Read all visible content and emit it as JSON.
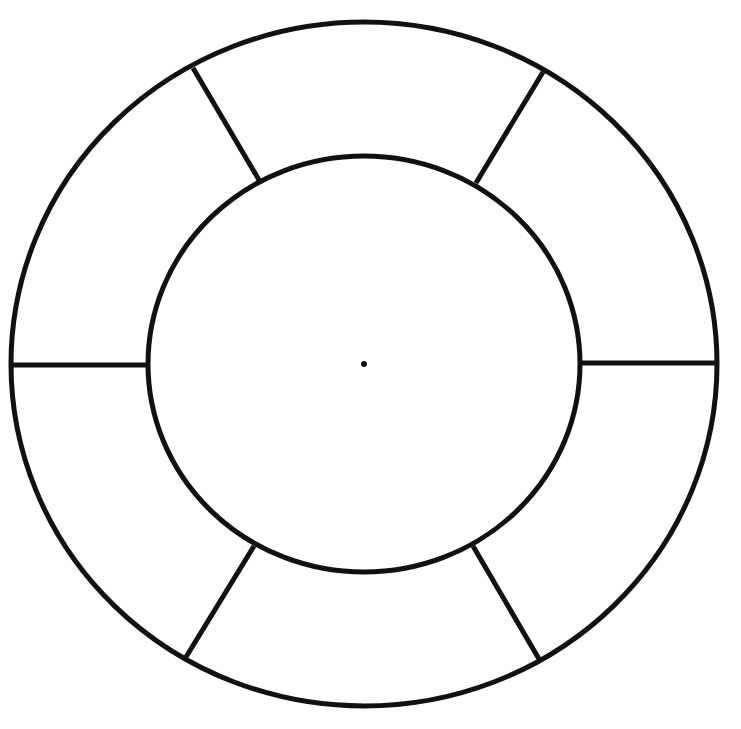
{
  "diagram": {
    "type": "segmented-ring-wheel",
    "stroke_color": "#111111",
    "background": "#ffffff",
    "center": [
      364,
      364
    ],
    "outer_ring": {
      "rx": 353,
      "ry": 342
    },
    "inner_circle": {
      "rx": 216,
      "ry": 208
    },
    "segment_count": 6,
    "spokes": [
      {
        "from": [
          259,
          180
        ],
        "to": [
          193,
          68
        ]
      },
      {
        "from": [
          476,
          183
        ],
        "to": [
          543,
          72
        ]
      },
      {
        "from": [
          580,
          363
        ],
        "to": [
          718,
          363
        ]
      },
      {
        "from": [
          473,
          546
        ],
        "to": [
          539,
          659
        ]
      },
      {
        "from": [
          254,
          546
        ],
        "to": [
          186,
          657
        ]
      },
      {
        "from": [
          148,
          365
        ],
        "to": [
          11,
          365
        ]
      }
    ]
  }
}
